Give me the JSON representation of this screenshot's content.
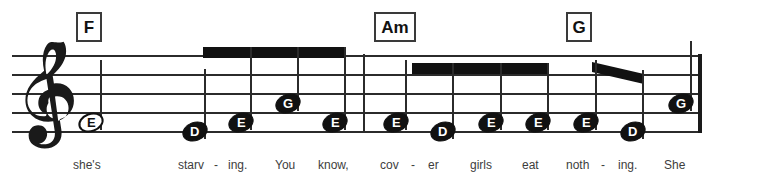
{
  "score": {
    "clef": "treble-clef",
    "staff": {
      "left": 12,
      "right": 700,
      "line_ys": [
        55,
        74,
        93,
        112,
        131
      ],
      "line_count": 5
    },
    "chords": [
      {
        "label": "F",
        "x": 76,
        "y": 12,
        "width": 26
      },
      {
        "label": "Am",
        "x": 374,
        "y": 12,
        "width": 42
      },
      {
        "label": "G",
        "x": 566,
        "y": 12,
        "width": 26
      }
    ],
    "barlines": [
      {
        "x": 363,
        "y": 54,
        "height": 79,
        "type": "single"
      },
      {
        "x": 698,
        "y": 54,
        "height": 79,
        "type": "final"
      }
    ],
    "notes": [
      {
        "letter": "E",
        "x": 78,
        "y": 122,
        "head": "hollow",
        "stem": "up",
        "lyric": "she's"
      },
      {
        "letter": "D",
        "x": 182,
        "y": 131,
        "head": "filled",
        "stem": "up",
        "lyric": "starv"
      },
      {
        "letter": "E",
        "x": 228,
        "y": 122,
        "head": "filled",
        "stem": "up",
        "lyric": "ing."
      },
      {
        "letter": "G",
        "x": 275,
        "y": 103,
        "head": "filled",
        "stem": "up",
        "lyric": "You"
      },
      {
        "letter": "E",
        "x": 322,
        "y": 122,
        "head": "filled",
        "stem": "up",
        "lyric": "know,"
      },
      {
        "letter": "E",
        "x": 383,
        "y": 122,
        "head": "filled",
        "stem": "up",
        "lyric": "cov"
      },
      {
        "letter": "D",
        "x": 430,
        "y": 131,
        "head": "filled",
        "stem": "up",
        "lyric": "er"
      },
      {
        "letter": "E",
        "x": 478,
        "y": 122,
        "head": "filled",
        "stem": "up",
        "lyric": "girls"
      },
      {
        "letter": "E",
        "x": 525,
        "y": 122,
        "head": "filled",
        "stem": "up",
        "lyric": "eat"
      },
      {
        "letter": "E",
        "x": 573,
        "y": 122,
        "head": "filled",
        "stem": "up",
        "lyric": "noth"
      },
      {
        "letter": "D",
        "x": 620,
        "y": 131,
        "head": "filled",
        "stem": "up",
        "lyric": "ing."
      },
      {
        "letter": "G",
        "x": 668,
        "y": 103,
        "head": "filled",
        "stem": "up",
        "lyric": "She"
      }
    ],
    "beams": [
      {
        "name": "beam-group-1",
        "x": 203,
        "y": 47,
        "width": 142,
        "height": 11,
        "slant": "flat"
      },
      {
        "name": "beam-group-2",
        "x": 412,
        "y": 63,
        "width": 136,
        "height": 11,
        "slant": "flat"
      },
      {
        "name": "beam-group-3",
        "x": 592,
        "y": 62,
        "width": 52,
        "height": 11,
        "slant": "down"
      }
    ],
    "hyphens": [
      {
        "x": 214,
        "y": 163
      },
      {
        "x": 411,
        "y": 163
      },
      {
        "x": 601,
        "y": 163
      }
    ],
    "lyrics_line": "she's starv - ing. You know, cov - er girls eat noth - ing. She",
    "lyric_positions": [
      {
        "text": "she's",
        "x": 73
      },
      {
        "text": "starv",
        "x": 178
      },
      {
        "text": "ing.",
        "x": 228
      },
      {
        "text": "You",
        "x": 275
      },
      {
        "text": "know,",
        "x": 318
      },
      {
        "text": "cov",
        "x": 380
      },
      {
        "text": "er",
        "x": 428
      },
      {
        "text": "girls",
        "x": 470
      },
      {
        "text": "eat",
        "x": 522
      },
      {
        "text": "noth",
        "x": 566
      },
      {
        "text": "ing.",
        "x": 618
      },
      {
        "text": "She",
        "x": 664
      }
    ],
    "colors": {
      "ink": "#111111",
      "staff": "#2b2b2b",
      "lyric": "#3d3d3d",
      "paper": "#ffffff"
    }
  }
}
